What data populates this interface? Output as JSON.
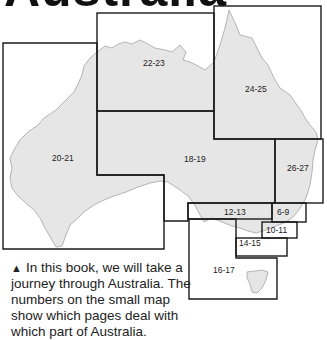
{
  "title": "Australia",
  "map": {
    "land_color": "#e6e6e6",
    "coast_color": "#b4b4b4",
    "border_color": "#1a1a1a",
    "regions": [
      {
        "label": "22-23"
      },
      {
        "label": "24-25"
      },
      {
        "label": "20-21"
      },
      {
        "label": "18-19"
      },
      {
        "label": "26-27"
      },
      {
        "label": "12-13"
      },
      {
        "label": "6-9"
      },
      {
        "label": "10-11"
      },
      {
        "label": "14-15"
      },
      {
        "label": "16-17"
      }
    ]
  },
  "caption": {
    "marker": "▲",
    "text": "In this book, we will take a journey through Australia. The numbers on the small map show which pages deal with which part of Australia."
  }
}
